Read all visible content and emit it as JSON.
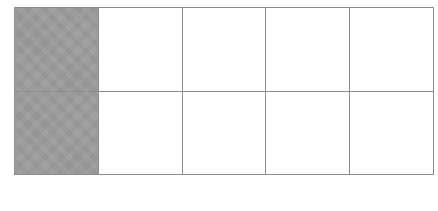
{
  "figure": {
    "kind": "area-model-grid",
    "background_color": "#ffffff",
    "border_color": "#8d8d8d",
    "shaded_color": "#9a9a9a",
    "unshaded_color": "#ffffff",
    "columns": 5,
    "rows": 2,
    "total_cells": 10,
    "shaded_cells": 2,
    "unshaded_cells": 8,
    "shaded_fraction": "2/10",
    "shaded_percent": "20%"
  },
  "grid": {
    "rows": [
      {
        "row_index": "1",
        "cells": [
          {
            "label": "",
            "state": "shaded"
          },
          {
            "label": "",
            "state": "empty"
          },
          {
            "label": "",
            "state": "empty"
          },
          {
            "label": "",
            "state": "empty"
          },
          {
            "label": "",
            "state": "empty"
          }
        ]
      },
      {
        "row_index": "2",
        "cells": [
          {
            "label": "",
            "state": "shaded"
          },
          {
            "label": "",
            "state": "empty"
          },
          {
            "label": "",
            "state": "empty"
          },
          {
            "label": "",
            "state": "empty"
          },
          {
            "label": "",
            "state": "empty"
          }
        ]
      }
    ]
  }
}
